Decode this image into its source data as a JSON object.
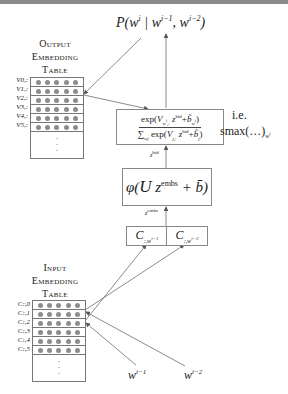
{
  "output_table": {
    "title_lines": [
      "Output",
      "Embedding",
      "Table"
    ],
    "row_labels": [
      "V0,:",
      "V1,:",
      "V2,:",
      "V3,:",
      "V4,:",
      "V5,:"
    ],
    "rows": 6,
    "dots_per_row": 5,
    "ellipsis": "⋮"
  },
  "input_table": {
    "title_lines": [
      "Input",
      "Embedding",
      "Table"
    ],
    "row_labels": [
      "C:,0",
      "C:,1",
      "C:,2",
      "C:,3",
      "C:,4",
      "C:,5"
    ],
    "rows": 6,
    "dots_per_row": 5,
    "ellipsis": "⋮"
  },
  "probability_label": "P(wⁱ | wⁱ⁻¹, wⁱ⁻²)",
  "softmax_box": {
    "numerator": "exp(V_{wⁱ,:} z^hid + b̃_{wⁱ})",
    "denominator": "∑_{wj} exp(V_{j,:} z^hid + b̃_j)",
    "note_line1": "i.e.",
    "note_line2": "smax(…)_{wⁱ}"
  },
  "z_hid_label": "z^hid",
  "hidden_box": {
    "formula": "φ(U z^embs + b̄)"
  },
  "z_embs_label": "z^embs",
  "context_boxes": [
    {
      "label": "C_{:,wⁱ⁻¹}"
    },
    {
      "label": "C_{:,wⁱ⁻²}"
    }
  ],
  "inputs": [
    {
      "label": "wⁱ⁻¹"
    },
    {
      "label": "wⁱ⁻²"
    }
  ],
  "colors": {
    "line": "#6e6e6e",
    "dot": "#8c8c8c",
    "border": "#888888",
    "topbar": "#8a8a8a"
  }
}
